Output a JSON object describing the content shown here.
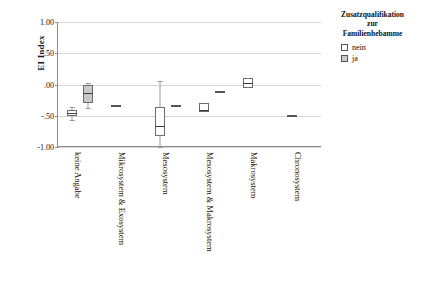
{
  "chart_data": {
    "type": "box",
    "title": "",
    "xlabel": "",
    "ylabel": "EI Index",
    "ylim": [
      -1.0,
      1.0
    ],
    "y_ticks": [
      "1.00",
      ".50",
      ".00",
      "-.50",
      "-1.00"
    ],
    "y_tick_values": [
      1.0,
      0.5,
      0.0,
      -0.5,
      -1.0
    ],
    "grid": true,
    "categories": [
      "keine Angabe",
      "Mikrosystem & Exosystem",
      "Mesosystem",
      "Mesosystem & Makrosystem",
      "Makrosystem",
      "Chronosystem"
    ],
    "legend": {
      "title_lines": [
        "Zusatzqualifikation",
        "zur",
        "Familienhebamme"
      ],
      "position": "right",
      "entries": [
        {
          "label": "nein",
          "fill": "#ffffff"
        },
        {
          "label": "ja",
          "fill": "#c9c9c9"
        }
      ]
    },
    "series": [
      {
        "name": "nein",
        "fill": "#ffffff",
        "boxes": [
          {
            "category": "keine Angabe",
            "whisker_low": -0.56,
            "q1": -0.5,
            "median": -0.45,
            "q3": -0.41,
            "whisker_high": -0.36,
            "flat": false
          },
          {
            "category": "Mikrosystem & Exosystem",
            "whisker_low": -0.35,
            "q1": -0.35,
            "median": -0.35,
            "q3": -0.35,
            "whisker_high": -0.35,
            "flat": true
          },
          {
            "category": "Mesosystem",
            "whisker_low": -1.0,
            "q1": -0.82,
            "median": -0.67,
            "q3": -0.36,
            "whisker_high": 0.05,
            "flat": false
          },
          {
            "category": "Mesosystem & Makrosystem",
            "whisker_low": -0.44,
            "q1": -0.44,
            "median": -0.41,
            "q3": -0.29,
            "whisker_high": -0.29,
            "flat": false
          },
          {
            "category": "Makrosystem",
            "whisker_low": -0.06,
            "q1": -0.06,
            "median": 0.02,
            "q3": 0.1,
            "whisker_high": 0.1,
            "flat": false
          },
          {
            "category": "Chronosystem",
            "whisker_low": -0.5,
            "q1": -0.5,
            "median": -0.5,
            "q3": -0.5,
            "whisker_high": -0.5,
            "flat": true
          }
        ]
      },
      {
        "name": "ja",
        "fill": "#c9c9c9",
        "boxes": [
          {
            "category": "keine Angabe",
            "whisker_low": -0.38,
            "q1": -0.3,
            "median": -0.14,
            "q3": -0.01,
            "whisker_high": 0.03,
            "flat": false
          },
          {
            "category": "Mikrosystem & Exosystem",
            "present": false
          },
          {
            "category": "Mesosystem",
            "whisker_low": -0.35,
            "q1": -0.35,
            "median": -0.35,
            "q3": -0.35,
            "whisker_high": -0.35,
            "flat": true
          },
          {
            "category": "Mesosystem & Makrosystem",
            "whisker_low": -0.12,
            "q1": -0.12,
            "median": -0.12,
            "q3": -0.12,
            "whisker_high": -0.12,
            "flat": true
          },
          {
            "category": "Makrosystem",
            "present": false
          },
          {
            "category": "Chronosystem",
            "present": false
          }
        ]
      }
    ]
  }
}
